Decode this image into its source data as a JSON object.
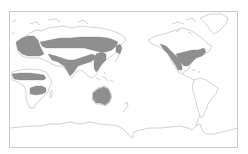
{
  "map": {
    "projection": "pacific-centered world",
    "colors": {
      "background": "#ffffff",
      "coastline": "#b4b4b4",
      "frame": "#c8c8c8",
      "distribution_fill": "#8f8f8f"
    },
    "distribution_regions": [
      {
        "name": "Europe"
      },
      {
        "name": "Northern Asia band"
      },
      {
        "name": "Central Asia"
      },
      {
        "name": "South and Southeast Asia"
      },
      {
        "name": "Japan"
      },
      {
        "name": "West Africa / Sahel band"
      },
      {
        "name": "Southern Africa band"
      },
      {
        "name": "Australia"
      },
      {
        "name": "Western North America"
      },
      {
        "name": "Eastern North America"
      }
    ]
  }
}
